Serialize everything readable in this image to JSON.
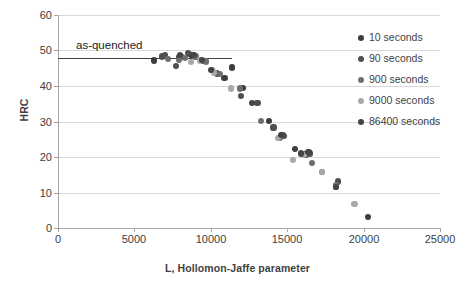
{
  "chart_data": {
    "type": "scatter",
    "title": "",
    "xlabel": "L, Hollomon-Jaffe parameter",
    "ylabel": "HRC",
    "xlim": [
      0,
      25000
    ],
    "ylim": [
      0,
      60
    ],
    "xticks": [
      0,
      5000,
      10000,
      15000,
      20000,
      25000
    ],
    "yticks": [
      0,
      10,
      20,
      30,
      40,
      50,
      60
    ],
    "xtick_labels": [
      "0",
      "5000",
      "10000",
      "15000",
      "20000",
      "25000"
    ],
    "ytick_labels": [
      "0",
      "10",
      "20",
      "30",
      "40",
      "50",
      "60"
    ],
    "grid": "horizontal",
    "legend_position": "right",
    "annotations": [
      {
        "name": "as-quenched",
        "text": "as-quenched",
        "type": "horizontal-line-with-label",
        "y_value": 47.8,
        "x_start": 0,
        "x_end": 11400,
        "color": "#404040",
        "label_x": 1200,
        "label_y": 51.5
      }
    ],
    "series": [
      {
        "name": "10 seconds",
        "label": "10 seconds",
        "color": "#3d3d3d",
        "points": [
          {
            "x": 6300,
            "y": 47.2
          },
          {
            "x": 7900,
            "y": 48.1
          },
          {
            "x": 8600,
            "y": 48.9
          },
          {
            "x": 8800,
            "y": 48.6
          },
          {
            "x": 10900,
            "y": 42.3
          },
          {
            "x": 11400,
            "y": 45.2
          },
          {
            "x": 12100,
            "y": 39.4
          },
          {
            "x": 13000,
            "y": 35.3
          },
          {
            "x": 13800,
            "y": 30.2
          },
          {
            "x": 14700,
            "y": 26.2
          },
          {
            "x": 15500,
            "y": 22.2
          },
          {
            "x": 16400,
            "y": 21.2
          },
          {
            "x": 18200,
            "y": 11.6
          },
          {
            "x": 20300,
            "y": 3.2
          }
        ]
      },
      {
        "name": "90 seconds",
        "label": "90 seconds",
        "color": "#4f4f4f",
        "points": [
          {
            "x": 6800,
            "y": 48.3
          },
          {
            "x": 7000,
            "y": 48.8
          },
          {
            "x": 7700,
            "y": 45.7
          },
          {
            "x": 8100,
            "y": 48.2
          },
          {
            "x": 8500,
            "y": 49.3
          },
          {
            "x": 9500,
            "y": 47.1
          },
          {
            "x": 10400,
            "y": 43.5
          },
          {
            "x": 12000,
            "y": 37.2
          },
          {
            "x": 13100,
            "y": 35.2
          },
          {
            "x": 14100,
            "y": 28.3
          },
          {
            "x": 14800,
            "y": 26.0
          },
          {
            "x": 16200,
            "y": 20.7
          },
          {
            "x": 16500,
            "y": 21.0
          },
          {
            "x": 18300,
            "y": 13.1
          }
        ]
      },
      {
        "name": "900 seconds",
        "label": "900 seconds",
        "color": "#6e6e6e",
        "points": [
          {
            "x": 7200,
            "y": 47.6
          },
          {
            "x": 7900,
            "y": 47.4
          },
          {
            "x": 8300,
            "y": 47.9
          },
          {
            "x": 9000,
            "y": 48.3
          },
          {
            "x": 9700,
            "y": 46.9
          },
          {
            "x": 10100,
            "y": 44.4
          },
          {
            "x": 10600,
            "y": 43.3
          },
          {
            "x": 11900,
            "y": 39.3
          },
          {
            "x": 13300,
            "y": 30.2
          },
          {
            "x": 14500,
            "y": 25.4
          },
          {
            "x": 16600,
            "y": 18.3
          },
          {
            "x": 17300,
            "y": 15.7
          },
          {
            "x": 18200,
            "y": 12.0
          }
        ]
      },
      {
        "name": "9000 seconds",
        "label": "9000 seconds",
        "color": "#a8a8a8",
        "points": [
          {
            "x": 8700,
            "y": 46.7
          },
          {
            "x": 9300,
            "y": 47.2
          },
          {
            "x": 10200,
            "y": 43.8
          },
          {
            "x": 11300,
            "y": 39.3
          },
          {
            "x": 14400,
            "y": 25.3
          },
          {
            "x": 15400,
            "y": 19.1
          },
          {
            "x": 16100,
            "y": 20.5
          },
          {
            "x": 17300,
            "y": 15.7
          },
          {
            "x": 19400,
            "y": 6.7
          }
        ]
      },
      {
        "name": "86400 seconds",
        "label": "86400 seconds",
        "color": "#454545",
        "points": [
          {
            "x": 8000,
            "y": 48.7
          },
          {
            "x": 8900,
            "y": 48.7
          },
          {
            "x": 9400,
            "y": 47.3
          },
          {
            "x": 10000,
            "y": 44.6
          },
          {
            "x": 12700,
            "y": 35.3
          },
          {
            "x": 14600,
            "y": 26.3
          },
          {
            "x": 15900,
            "y": 21.0
          },
          {
            "x": 16400,
            "y": 21.3
          },
          {
            "x": 18200,
            "y": 11.6
          }
        ]
      }
    ]
  }
}
